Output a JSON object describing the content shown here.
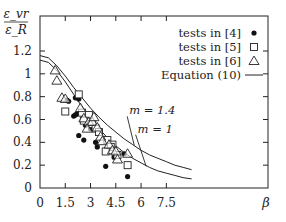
{
  "chart_data": {
    "type": "scatter",
    "title": "",
    "ylabel_num": "ε_vr",
    "ylabel_den": "ε_R",
    "xlabel": "β",
    "xlim": [
      0,
      9
    ],
    "ylim": [
      0,
      1.4
    ],
    "x_ticks": [
      0,
      1.5,
      3,
      4.5,
      6,
      7.5
    ],
    "x_tick_labels": [
      "0",
      "1.5",
      "3",
      "4.5",
      "6",
      "7.5"
    ],
    "y_ticks": [
      0,
      0.2,
      0.4,
      0.6,
      0.8,
      1,
      1.2
    ],
    "y_tick_labels": [
      "0",
      "0.2",
      "0.4",
      "0.6",
      "0.8",
      "1",
      "1.2"
    ],
    "legend": [
      {
        "label": "tests in [4]",
        "marker": "filled-circle"
      },
      {
        "label": "tests in [5]",
        "marker": "open-square"
      },
      {
        "label": "tests in [6]",
        "marker": "open-triangle"
      },
      {
        "label": "Equation (10)",
        "marker": "line"
      }
    ],
    "legend_position": "top-right",
    "series": [
      {
        "name": "tests in [4]",
        "marker": "filled-circle",
        "points": [
          [
            2.1,
            0.79
          ],
          [
            2.3,
            0.78
          ],
          [
            1.6,
            0.77
          ],
          [
            1.7,
            0.76
          ],
          [
            2.0,
            0.63
          ],
          [
            2.1,
            0.64
          ],
          [
            2.2,
            0.65
          ],
          [
            2.7,
            0.55
          ],
          [
            3.0,
            0.52
          ],
          [
            2.3,
            0.46
          ],
          [
            2.6,
            0.42
          ],
          [
            3.3,
            0.4
          ],
          [
            3.4,
            0.36
          ],
          [
            4.1,
            0.38
          ],
          [
            5.0,
            0.3
          ],
          [
            3.9,
            0.19
          ],
          [
            4.4,
            0.27
          ],
          [
            5.2,
            0.1
          ]
        ]
      },
      {
        "name": "tests in [5]",
        "marker": "open-square",
        "points": [
          [
            2.3,
            0.82
          ],
          [
            1.5,
            0.67
          ],
          [
            2.5,
            0.66
          ],
          [
            2.9,
            0.64
          ],
          [
            3.1,
            0.56
          ],
          [
            2.6,
            0.59
          ],
          [
            3.3,
            0.52
          ],
          [
            3.5,
            0.49
          ],
          [
            4.0,
            0.42
          ],
          [
            4.3,
            0.38
          ],
          [
            4.6,
            0.29
          ],
          [
            5.2,
            0.2
          ],
          [
            4.2,
            0.36
          ],
          [
            3.9,
            0.32
          ]
        ]
      },
      {
        "name": "tests in [6]",
        "marker": "open-triangle",
        "points": [
          [
            0.9,
            1.03
          ],
          [
            1.0,
            0.94
          ],
          [
            1.3,
            0.79
          ],
          [
            1.5,
            0.78
          ],
          [
            2.4,
            0.7
          ],
          [
            2.6,
            0.61
          ],
          [
            2.9,
            0.58
          ],
          [
            3.1,
            0.58
          ],
          [
            3.4,
            0.53
          ],
          [
            3.6,
            0.45
          ],
          [
            3.7,
            0.41
          ],
          [
            4.1,
            0.38
          ],
          [
            4.3,
            0.33
          ],
          [
            4.5,
            0.32
          ],
          [
            5.2,
            0.3
          ],
          [
            4.6,
            0.25
          ],
          [
            3.2,
            0.62
          ],
          [
            2.8,
            0.52
          ]
        ]
      }
    ],
    "curves": [
      {
        "name": "Equation (10)",
        "label": "m = 1.4",
        "points": [
          [
            0,
            1.16
          ],
          [
            0.5,
            1.14
          ],
          [
            1,
            1.07
          ],
          [
            1.5,
            0.98
          ],
          [
            2,
            0.88
          ],
          [
            2.5,
            0.79
          ],
          [
            3,
            0.7
          ],
          [
            3.5,
            0.62
          ],
          [
            4,
            0.55
          ],
          [
            4.5,
            0.49
          ],
          [
            5,
            0.43
          ],
          [
            5.5,
            0.38
          ],
          [
            6,
            0.33
          ],
          [
            6.5,
            0.29
          ],
          [
            7,
            0.26
          ],
          [
            7.5,
            0.23
          ],
          [
            8,
            0.2
          ],
          [
            8.5,
            0.18
          ],
          [
            9,
            0.16
          ]
        ]
      },
      {
        "name": "Equation (10)",
        "label": "m = 1",
        "points": [
          [
            0,
            1.12
          ],
          [
            0.5,
            1.1
          ],
          [
            1,
            1.03
          ],
          [
            1.5,
            0.93
          ],
          [
            2,
            0.82
          ],
          [
            2.5,
            0.71
          ],
          [
            3,
            0.61
          ],
          [
            3.5,
            0.52
          ],
          [
            4,
            0.44
          ],
          [
            4.5,
            0.37
          ],
          [
            5,
            0.31
          ],
          [
            5.5,
            0.26
          ],
          [
            6,
            0.22
          ],
          [
            6.5,
            0.18
          ],
          [
            7,
            0.15
          ],
          [
            7.5,
            0.13
          ],
          [
            8,
            0.11
          ],
          [
            8.5,
            0.09
          ],
          [
            9,
            0.08
          ]
        ]
      }
    ],
    "annotations": [
      {
        "text": "m = 1.4",
        "at": [
          6.6,
          0.68
        ],
        "points_to": [
          5.6,
          0.37
        ]
      },
      {
        "text": "m = 1",
        "at": [
          7.1,
          0.52
        ],
        "points_to": [
          6.3,
          0.19
        ]
      }
    ],
    "grid": false
  }
}
